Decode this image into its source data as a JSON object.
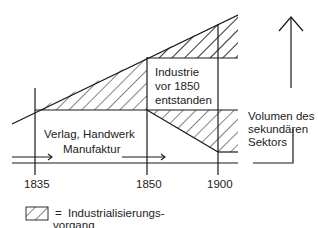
{
  "diagram": {
    "type": "process-diagram",
    "years": [
      "1835",
      "1850",
      "1900"
    ],
    "regions": {
      "pre_industrial": "Verlag, Handwerk",
      "pre_industrial_line2": "Manufaktur",
      "industry_before_1850_line1": "Industrie",
      "industry_before_1850_line2": "vor 1850",
      "industry_before_1850_line3": "entstanden"
    },
    "axis": {
      "label_line1": "Volumen des",
      "label_line2": "sekundären",
      "label_line3": "Sektors"
    },
    "legend": {
      "symbol": "hatched-box",
      "equals": "=",
      "text_line1": "Industrialisierungs-",
      "text_line2": "vorgang"
    },
    "colors": {
      "line": "#1a1a1a",
      "background": "#ffffff"
    }
  }
}
